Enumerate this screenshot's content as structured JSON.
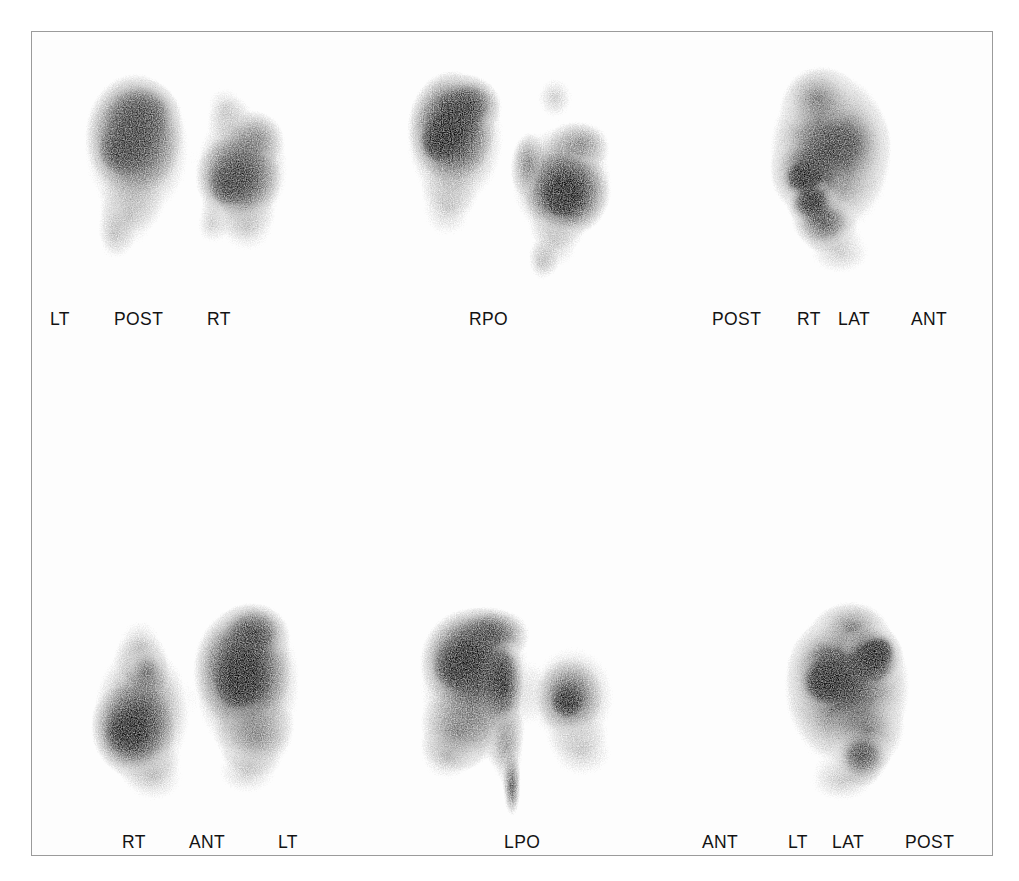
{
  "figure": {
    "modality": "nuclear-medicine-lung-scintigraphy",
    "panel_count": 6,
    "frame_border_color": "#9b9b9b",
    "plate_background": "#fefefe",
    "label_color": "#131313",
    "scan_ink_color": "#000000"
  },
  "panels": {
    "top": [
      {
        "id": "posterior",
        "view_name": "POST",
        "labels": [
          {
            "text": "LT",
            "position": "left"
          },
          {
            "text": "POST",
            "position": "center"
          },
          {
            "text": "RT",
            "position": "right"
          }
        ]
      },
      {
        "id": "right-posterior-oblique",
        "view_name": "RPO",
        "labels": [
          {
            "text": "RPO",
            "position": "center"
          }
        ]
      },
      {
        "id": "right-lateral",
        "view_name": "RT LAT",
        "labels": [
          {
            "text": "POST",
            "position": "left"
          },
          {
            "text": "RT",
            "position": "center-left"
          },
          {
            "text": "LAT",
            "position": "center-right"
          },
          {
            "text": "ANT",
            "position": "right"
          }
        ]
      }
    ],
    "bottom": [
      {
        "id": "anterior",
        "view_name": "ANT",
        "labels": [
          {
            "text": "RT",
            "position": "left"
          },
          {
            "text": "ANT",
            "position": "center"
          },
          {
            "text": "LT",
            "position": "right"
          }
        ]
      },
      {
        "id": "left-posterior-oblique",
        "view_name": "LPO",
        "labels": [
          {
            "text": "LPO",
            "position": "center"
          }
        ]
      },
      {
        "id": "left-lateral",
        "view_name": "LT LAT",
        "labels": [
          {
            "text": "ANT",
            "position": "left"
          },
          {
            "text": "LT",
            "position": "center-left"
          },
          {
            "text": "LAT",
            "position": "center-right"
          },
          {
            "text": "POST",
            "position": "right"
          }
        ]
      }
    ]
  },
  "labels_flat": {
    "top_row": {
      "lt": "LT",
      "post": "POST",
      "rt": "RT",
      "rpo": "RPO",
      "rlat_post": "POST",
      "rlat_rt": "RT",
      "rlat_lat": "LAT",
      "rlat_ant": "ANT"
    },
    "bottom_row": {
      "rt": "RT",
      "ant": "ANT",
      "lt": "LT",
      "lpo": "LPO",
      "llat_ant": "ANT",
      "llat_lt": "LT",
      "llat_lat": "LAT",
      "llat_post": "POST"
    }
  }
}
